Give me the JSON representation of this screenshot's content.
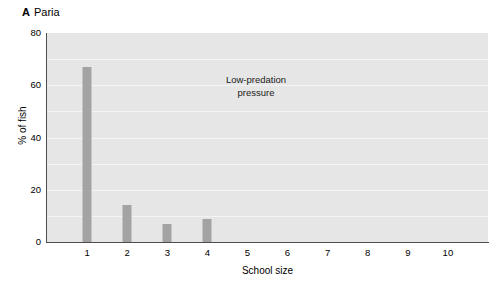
{
  "panel": {
    "letter": "A",
    "title": "Paria"
  },
  "annotation": {
    "line1": "Low-predation",
    "line2": "pressure"
  },
  "colors": {
    "plot_background": "#e6e6e6",
    "gridline": "#f4f4f4",
    "bar": "#a3a3a3",
    "axis": "#4d4d4d",
    "text": "#000000"
  },
  "chart_data": {
    "type": "bar",
    "xlabel": "School size",
    "ylabel": "% of fish",
    "categories": [
      "1",
      "2",
      "3",
      "4",
      "5",
      "6",
      "7",
      "8",
      "9",
      "10"
    ],
    "values": [
      67,
      14,
      7,
      9,
      0,
      0,
      0,
      0,
      0,
      0
    ],
    "ylim": [
      0,
      80
    ],
    "y_ticks": [
      "0",
      "20",
      "40",
      "60",
      "80"
    ],
    "y_tick_values": [
      0,
      20,
      40,
      60,
      80
    ],
    "gridlines": [
      10,
      20,
      30,
      40,
      50,
      60,
      70
    ],
    "grid": true,
    "legend": "none",
    "annotations": [
      "Low-predation pressure"
    ]
  }
}
